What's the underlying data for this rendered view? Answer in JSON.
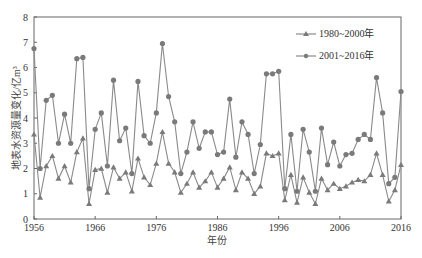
{
  "chart_data": {
    "type": "line",
    "title": "",
    "xlabel": "年份",
    "ylabel": "地表水资源量变化/亿m³",
    "xlim": [
      1956,
      2016
    ],
    "ylim": [
      0,
      8
    ],
    "x_ticks": [
      1956,
      1966,
      1976,
      1986,
      1996,
      2006,
      2016
    ],
    "y_ticks": [
      0,
      1,
      2,
      3,
      4,
      5,
      6,
      7,
      8
    ],
    "grid": false,
    "legend_position": "upper right",
    "x": [
      1956,
      1957,
      1958,
      1959,
      1960,
      1961,
      1962,
      1963,
      1964,
      1965,
      1966,
      1967,
      1968,
      1969,
      1970,
      1971,
      1972,
      1973,
      1974,
      1975,
      1976,
      1977,
      1978,
      1979,
      1980,
      1981,
      1982,
      1983,
      1984,
      1985,
      1986,
      1987,
      1988,
      1989,
      1990,
      1991,
      1992,
      1993,
      1994,
      1995,
      1996,
      1997,
      1998,
      1999,
      2000,
      2001,
      2002,
      2003,
      2004,
      2005,
      2006,
      2007,
      2008,
      2009,
      2010,
      2011,
      2012,
      2013,
      2014,
      2015,
      2016
    ],
    "series": [
      {
        "name": "1980~2000年",
        "marker": "triangle",
        "color": "#8a8a8a",
        "values": [
          3.35,
          0.85,
          2.1,
          2.5,
          1.6,
          2.1,
          1.45,
          2.65,
          3.2,
          0.6,
          1.95,
          2.0,
          1.05,
          2.05,
          1.6,
          1.85,
          1.1,
          2.4,
          1.65,
          1.35,
          2.2,
          3.45,
          2.2,
          1.85,
          1.05,
          1.4,
          1.85,
          1.25,
          1.5,
          1.85,
          1.25,
          1.6,
          2.05,
          1.15,
          1.85,
          1.6,
          1.0,
          1.3,
          2.6,
          2.5,
          2.6,
          0.75,
          1.75,
          0.65,
          1.65,
          1.05,
          0.6,
          1.6,
          1.15,
          1.4,
          1.2,
          1.3,
          1.45,
          1.55,
          1.5,
          1.75,
          2.6,
          1.75,
          0.7,
          1.15,
          2.15
        ]
      },
      {
        "name": "2001~2016年",
        "marker": "circle",
        "color": "#8a8a8a",
        "values": [
          6.75,
          2.0,
          4.7,
          4.9,
          3.0,
          4.15,
          3.0,
          6.35,
          6.4,
          1.2,
          3.55,
          4.2,
          2.1,
          5.5,
          3.1,
          3.6,
          1.8,
          5.45,
          3.3,
          3.0,
          4.2,
          6.95,
          4.85,
          3.85,
          1.8,
          2.65,
          3.85,
          2.8,
          3.45,
          3.45,
          2.55,
          2.65,
          4.75,
          2.45,
          3.85,
          3.35,
          1.8,
          2.95,
          5.75,
          5.75,
          5.85,
          1.2,
          3.35,
          1.1,
          3.55,
          2.65,
          1.1,
          3.6,
          2.15,
          3.05,
          2.1,
          2.55,
          2.6,
          3.15,
          3.35,
          3.15,
          5.6,
          4.2,
          1.4,
          1.65,
          5.05
        ]
      }
    ]
  },
  "legend": {
    "items": [
      {
        "label": "1980~2000年",
        "marker": "triangle"
      },
      {
        "label": "2001~2016年",
        "marker": "circle"
      }
    ]
  },
  "axes": {
    "x_title": "年份",
    "y_title": "地表水资源量变化/亿m³"
  },
  "colors": {
    "line": "#8a8a8a",
    "marker": "#7a7a7a",
    "axis": "#555555"
  }
}
